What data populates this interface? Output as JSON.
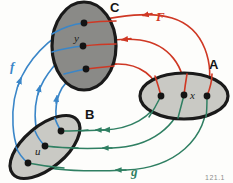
{
  "figure": {
    "caption_number": "121.1",
    "sets": [
      {
        "id": "C",
        "label": "C",
        "fill": "#8a8a87",
        "stroke": "#1a1a1a",
        "label_x": 110,
        "label_y": 12,
        "elements": [
          {
            "name": "c1",
            "label": "",
            "x": 84,
            "y": 23
          },
          {
            "name": "c2",
            "label": "y",
            "x": 83,
            "y": 46
          },
          {
            "name": "c3",
            "label": "",
            "x": 86,
            "y": 69
          }
        ]
      },
      {
        "id": "A",
        "label": "A",
        "fill": "#c9c9c4",
        "stroke": "#1a1a1a",
        "label_x": 209,
        "label_y": 69,
        "elements": [
          {
            "name": "a1",
            "label": "",
            "x": 161,
            "y": 96
          },
          {
            "name": "a2",
            "label": "x",
            "x": 184,
            "y": 95
          },
          {
            "name": "a3",
            "label": "",
            "x": 207,
            "y": 96
          }
        ]
      },
      {
        "id": "B",
        "label": "B",
        "fill": "#c9c9c4",
        "stroke": "#1a1a1a",
        "label_x": 85,
        "label_y": 119,
        "elements": [
          {
            "name": "b1",
            "label": "",
            "x": 61,
            "y": 131
          },
          {
            "name": "b2",
            "label": "u",
            "x": 45,
            "y": 146
          },
          {
            "name": "b3",
            "label": "",
            "x": 28,
            "y": 163
          }
        ]
      }
    ],
    "mappings": [
      {
        "name": "F",
        "label": "F",
        "color": "#cf3824",
        "from": "A",
        "to": "C",
        "label_x": 156,
        "label_y": 21
      },
      {
        "name": "f",
        "label": "f",
        "color": "#3a86c8",
        "from": "B",
        "to": "C",
        "label_x": 10,
        "label_y": 71
      },
      {
        "name": "g",
        "label": "g",
        "color": "#2f7f62",
        "from": "A",
        "to": "B",
        "label_x": 131,
        "label_y": 176
      }
    ]
  }
}
